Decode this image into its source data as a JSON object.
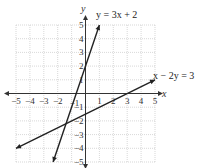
{
  "chart_data": {
    "type": "line",
    "title": "",
    "xlabel": "x",
    "ylabel": "y",
    "xlim": [
      -5,
      5
    ],
    "ylim": [
      -5,
      5
    ],
    "grid": true,
    "x_ticks": [
      "-5",
      "-4",
      "-3",
      "-2",
      "-1",
      "1",
      "2",
      "3",
      "4",
      "5"
    ],
    "y_ticks": [
      "5",
      "4",
      "3",
      "2",
      "1",
      "-1",
      "-2",
      "-3",
      "-4",
      "-5"
    ],
    "series": [
      {
        "name": "y = 3x + 2",
        "label": "y = 3x + 2",
        "points": [
          [
            -2.333,
            -5
          ],
          [
            1,
            5
          ]
        ],
        "color": "#222222"
      },
      {
        "name": "x - 2y = 3",
        "label": "x − 2y = 3",
        "points": [
          [
            -5,
            -4
          ],
          [
            5,
            1
          ]
        ],
        "color": "#222222"
      }
    ],
    "intersection": [
      -1,
      -1
    ]
  },
  "labels": {
    "x_axis": "x",
    "y_axis": "y",
    "line1": "y = 3x + 2",
    "line2": "x − 2y = 3"
  }
}
